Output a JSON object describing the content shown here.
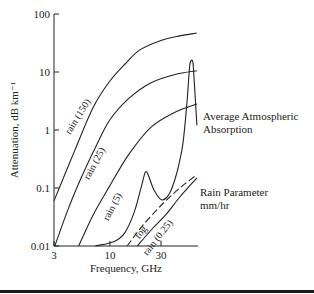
{
  "chart_data": {
    "type": "line",
    "title": "",
    "xlabel": "Frequency, GHz",
    "ylabel": "Attenuation, dB km⁻¹",
    "xscale": "log",
    "yscale": "log",
    "xlim": [
      3,
      65
    ],
    "ylim": [
      0.01,
      100
    ],
    "x_ticks": [
      3,
      10,
      30
    ],
    "x_tick_labels": [
      "3",
      "10",
      "30"
    ],
    "y_ticks": [
      0.01,
      0.1,
      1,
      10,
      100
    ],
    "y_tick_labels": [
      "0.01",
      "0.1",
      "1",
      "10",
      "100"
    ],
    "grid": false,
    "series": [
      {
        "name": "rain (150)",
        "label": "rain (150)",
        "style": "solid",
        "points": [
          [
            3,
            0.06
          ],
          [
            4.7,
            0.45
          ],
          [
            7,
            2.5
          ],
          [
            10,
            7
          ],
          [
            14,
            14
          ],
          [
            19,
            24
          ],
          [
            30,
            35
          ],
          [
            45,
            42
          ],
          [
            65,
            47
          ]
        ]
      },
      {
        "name": "rain (25)",
        "label": "rain (25)",
        "style": "solid",
        "points": [
          [
            3.05,
            0.01
          ],
          [
            4,
            0.04
          ],
          [
            5.3,
            0.14
          ],
          [
            7.5,
            0.55
          ],
          [
            10,
            1.5
          ],
          [
            15,
            3.5
          ],
          [
            24,
            6.5
          ],
          [
            40,
            9
          ],
          [
            65,
            10.5
          ]
        ]
      },
      {
        "name": "rain (5)",
        "label": "rain (5)",
        "style": "solid",
        "points": [
          [
            5.1,
            0.01
          ],
          [
            7,
            0.035
          ],
          [
            10,
            0.11
          ],
          [
            15,
            0.38
          ],
          [
            24,
            1.1
          ],
          [
            40,
            2.0
          ],
          [
            65,
            2.8
          ]
        ]
      },
      {
        "name": "fog",
        "label": "fog",
        "style": "dashed",
        "points": [
          [
            14.5,
            0.01
          ],
          [
            20,
            0.022
          ],
          [
            30,
            0.05
          ],
          [
            45,
            0.1
          ],
          [
            65,
            0.17
          ]
        ]
      },
      {
        "name": "rain (0.25)",
        "label": "rain (0.25)",
        "style": "solid",
        "points": [
          [
            18,
            0.01
          ],
          [
            25,
            0.02
          ],
          [
            33,
            0.034
          ],
          [
            45,
            0.07
          ],
          [
            65,
            0.15
          ]
        ]
      },
      {
        "name": "Average Atmospheric Absorption",
        "label": "Average Atmospheric Absorption",
        "style": "solid",
        "points": [
          [
            7.3,
            0.01
          ],
          [
            11,
            0.012
          ],
          [
            13.8,
            0.017
          ],
          [
            17,
            0.04
          ],
          [
            20,
            0.12
          ],
          [
            21.5,
            0.19
          ],
          [
            23,
            0.16
          ],
          [
            26,
            0.09
          ],
          [
            31,
            0.062
          ],
          [
            38,
            0.1
          ],
          [
            47,
            0.45
          ],
          [
            52,
            2.5
          ],
          [
            55,
            10
          ],
          [
            56.5,
            15
          ],
          [
            59.5,
            15
          ],
          [
            61,
            8
          ],
          [
            65,
            1.2
          ]
        ]
      }
    ],
    "annotations": [
      {
        "text": "Average Atmospheric",
        "line2": "Absorption"
      },
      {
        "text": "Rain Parameter",
        "line2": "mm/hr"
      }
    ]
  }
}
